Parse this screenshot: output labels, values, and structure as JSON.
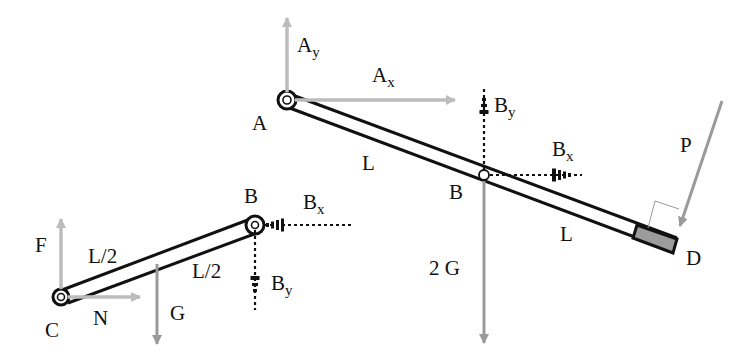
{
  "diagram": {
    "type": "free-body diagram",
    "colors": {
      "bar_stroke": "#111111",
      "solid_force": "#999999",
      "reaction_force": "#b0b0b0",
      "dashed_force": "#111111",
      "end_block": "#999999"
    },
    "right_member": {
      "points": {
        "A": {
          "label": "A"
        },
        "B": {
          "label": "B"
        },
        "D": {
          "label": "D"
        }
      },
      "segments": [
        {
          "label": "L"
        },
        {
          "label": "L"
        }
      ],
      "forces": {
        "Ay": {
          "main": "A",
          "sub": "y"
        },
        "Ax": {
          "main": "A",
          "sub": "x"
        },
        "By": {
          "main": "B",
          "sub": "y"
        },
        "Bx": {
          "main": "B",
          "sub": "x"
        },
        "weight": {
          "label": "2 G"
        },
        "P": {
          "label": "P"
        }
      }
    },
    "left_member": {
      "points": {
        "C": {
          "label": "C"
        },
        "B": {
          "label": "B"
        }
      },
      "segments": [
        {
          "label": "L/2"
        },
        {
          "label": "L/2"
        }
      ],
      "forces": {
        "F": {
          "label": "F"
        },
        "N": {
          "label": "N"
        },
        "G": {
          "label": "G"
        },
        "Bx": {
          "main": "B",
          "sub": "x"
        },
        "By": {
          "main": "B",
          "sub": "y"
        }
      }
    }
  }
}
